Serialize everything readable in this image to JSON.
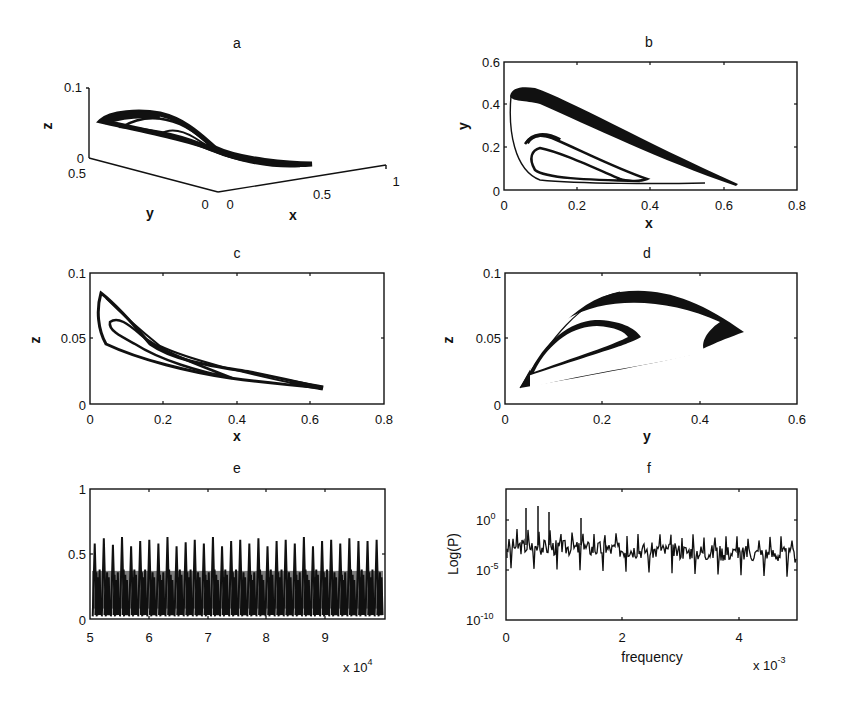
{
  "chart_data": [
    {
      "id": "a",
      "type": "line3d",
      "title": "a",
      "xlabel": "x",
      "ylabel": "y",
      "zlabel": "z",
      "xticks": [
        "0",
        "0.5",
        "1"
      ],
      "yticks": [
        "0.5",
        "0"
      ],
      "zticks": [
        "0",
        "0.1"
      ],
      "xlim": [
        0,
        1
      ],
      "ylim": [
        0,
        0.5
      ],
      "zlim": [
        0,
        0.1
      ],
      "description": "3D strange attractor trajectory forming two nested loops crossing near the center"
    },
    {
      "id": "b",
      "type": "line",
      "title": "b",
      "xlabel": "x",
      "ylabel": "y",
      "xticks": [
        "0",
        "0.2",
        "0.4",
        "0.6",
        "0.8"
      ],
      "yticks": [
        "0",
        "0.2",
        "0.4",
        "0.6"
      ],
      "xlim": [
        0,
        0.8
      ],
      "ylim": [
        0,
        0.6
      ],
      "series": [
        {
          "name": "outer loop",
          "x": [
            0.63,
            0.4,
            0.2,
            0.05,
            0.02,
            0.03,
            0.1,
            0.3,
            0.55,
            0.63
          ],
          "y": [
            0.03,
            0.17,
            0.32,
            0.44,
            0.38,
            0.2,
            0.08,
            0.04,
            0.035,
            0.03
          ]
        },
        {
          "name": "inner loop",
          "x": [
            0.39,
            0.25,
            0.1,
            0.05,
            0.08,
            0.2,
            0.39
          ],
          "y": [
            0.05,
            0.14,
            0.25,
            0.2,
            0.09,
            0.055,
            0.05
          ]
        }
      ]
    },
    {
      "id": "c",
      "type": "line",
      "title": "c",
      "xlabel": "x",
      "ylabel": "z",
      "xticks": [
        "0",
        "0.2",
        "0.4",
        "0.6",
        "0.8"
      ],
      "yticks": [
        "0",
        "0.05",
        "0.1"
      ],
      "xlim": [
        0,
        0.8
      ],
      "ylim": [
        0,
        0.1
      ],
      "series": [
        {
          "name": "outer loop",
          "x": [
            0.03,
            0.1,
            0.2,
            0.4,
            0.63,
            0.4,
            0.2,
            0.05,
            0.02,
            0.03
          ],
          "y": [
            0.084,
            0.06,
            0.036,
            0.026,
            0.013,
            0.017,
            0.03,
            0.042,
            0.06,
            0.084
          ]
        },
        {
          "name": "inner loop",
          "x": [
            0.05,
            0.12,
            0.2,
            0.4,
            0.2,
            0.08,
            0.05
          ],
          "y": [
            0.063,
            0.05,
            0.036,
            0.02,
            0.032,
            0.05,
            0.063
          ]
        }
      ]
    },
    {
      "id": "d",
      "type": "line",
      "title": "d",
      "xlabel": "y",
      "ylabel": "z",
      "xticks": [
        "0",
        "0.2",
        "0.4",
        "0.6"
      ],
      "yticks": [
        "0",
        "0.05",
        "0.1"
      ],
      "xlim": [
        0,
        0.6
      ],
      "ylim": [
        0,
        0.1
      ],
      "series": [
        {
          "name": "outer loop",
          "x": [
            0.03,
            0.1,
            0.25,
            0.4,
            0.48,
            0.4,
            0.2,
            0.03
          ],
          "y": [
            0.012,
            0.05,
            0.082,
            0.07,
            0.048,
            0.035,
            0.025,
            0.012
          ]
        },
        {
          "name": "inner loop",
          "x": [
            0.05,
            0.1,
            0.18,
            0.27,
            0.2,
            0.05
          ],
          "y": [
            0.02,
            0.05,
            0.062,
            0.048,
            0.035,
            0.02
          ]
        }
      ]
    },
    {
      "id": "e",
      "type": "line",
      "title": "e",
      "xlabel": "",
      "ylabel": "",
      "xticks": [
        "5",
        "6",
        "7",
        "8",
        "9"
      ],
      "x_multiplier": "x 10^4",
      "yticks": [
        "0",
        "0.5",
        "1"
      ],
      "xlim": [
        50000,
        100000
      ],
      "ylim": [
        0,
        1
      ],
      "description": "Time series of x oscillating between ~0.02 and peaks of ~0.55–0.63, ~32 spikes, dense band up to ~0.38",
      "peaks": [
        0.58,
        0.62,
        0.57,
        0.63,
        0.56,
        0.6,
        0.61,
        0.58,
        0.63,
        0.56,
        0.59,
        0.61,
        0.58,
        0.63,
        0.56,
        0.6,
        0.61,
        0.58,
        0.62,
        0.56,
        0.6,
        0.61,
        0.58,
        0.63,
        0.56,
        0.6,
        0.61,
        0.58,
        0.62,
        0.6,
        0.6,
        0.61
      ]
    },
    {
      "id": "f",
      "type": "line",
      "title": "f",
      "xlabel": "frequency",
      "ylabel": "Log(P)",
      "xticks": [
        "0",
        "2",
        "4"
      ],
      "x_multiplier": "x 10^-3",
      "yticks": [
        "10^-10",
        "10^-5",
        "10^0"
      ],
      "yscale": "log",
      "xlim": [
        0,
        0.005
      ],
      "ylim": [
        1e-10,
        1000.0
      ],
      "description": "Power spectrum: broadband noise around 1e-3 with peaks up to ~1e1 at low frequencies and dips to ~1e-6"
    }
  ],
  "labels": {
    "a": {
      "title": "a",
      "x": "x",
      "y": "y",
      "z": "z",
      "xt": [
        "0",
        "0.5",
        "1"
      ],
      "yt": [
        "0.5",
        "0"
      ],
      "zt": [
        "0.1",
        "0"
      ]
    },
    "b": {
      "title": "b",
      "x": "x",
      "y": "y",
      "xt": [
        "0",
        "0.2",
        "0.4",
        "0.6",
        "0.8"
      ],
      "yt": [
        "0.6",
        "0.4",
        "0.2",
        "0"
      ]
    },
    "c": {
      "title": "c",
      "x": "x",
      "y": "z",
      "xt": [
        "0",
        "0.2",
        "0.4",
        "0.6",
        "0.8"
      ],
      "yt": [
        "0.1",
        "0.05",
        "0"
      ]
    },
    "d": {
      "title": "d",
      "x": "y",
      "y": "z",
      "xt": [
        "0",
        "0.2",
        "0.4",
        "0.6"
      ],
      "yt": [
        "0.1",
        "0.05",
        "0"
      ]
    },
    "e": {
      "title": "e",
      "xt": [
        "5",
        "6",
        "7",
        "8",
        "9"
      ],
      "yt": [
        "1",
        "0.5",
        "0"
      ],
      "mult_base": "x 10",
      "mult_exp": "4"
    },
    "f": {
      "title": "f",
      "x": "frequency",
      "y": "Log(P)",
      "xt": [
        "0",
        "2",
        "4"
      ],
      "yt_base": "10",
      "yt_exp": [
        "0",
        "-5",
        "-10"
      ],
      "mult_base": "x 10",
      "mult_exp": "-3"
    }
  }
}
